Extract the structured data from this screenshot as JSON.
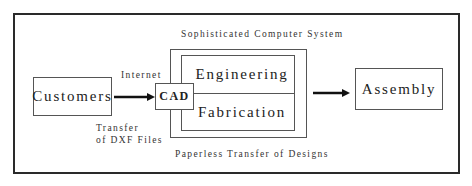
{
  "diagram": {
    "nodes": {
      "customers": "Customers",
      "cad": "CAD",
      "engineering": "Engineering",
      "fabrication": "Fabrication",
      "assembly": "Assembly"
    },
    "labels": {
      "system_title": "Sophisticated Computer System",
      "internet": "Internet",
      "transfer_line1": "Transfer",
      "transfer_line2": "of DXF Files",
      "paperless": "Paperless Transfer of Designs"
    },
    "edges": [
      {
        "from": "customers",
        "to": "cad",
        "label": "Internet"
      },
      {
        "from": "sophisticated_computer_system",
        "to": "assembly",
        "label": ""
      }
    ],
    "colors": {
      "stroke": "#2a2a2a",
      "text": "#222222",
      "background": "#ffffff"
    }
  }
}
